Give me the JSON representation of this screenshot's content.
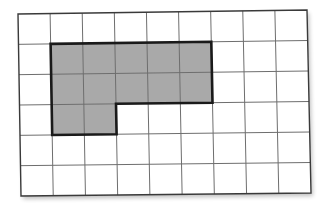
{
  "figure": {
    "type": "grid-area-diagram",
    "grid": {
      "columns": 9,
      "rows": 6
    },
    "shaded_shape": {
      "description": "L-shaped polygon",
      "cells": [
        [
          1,
          1
        ],
        [
          2,
          1
        ],
        [
          3,
          1
        ],
        [
          4,
          1
        ],
        [
          5,
          1
        ],
        [
          1,
          2
        ],
        [
          2,
          2
        ],
        [
          3,
          2
        ],
        [
          4,
          2
        ],
        [
          5,
          2
        ],
        [
          1,
          3
        ],
        [
          2,
          3
        ]
      ],
      "area_units": 12,
      "fill_color": "#a9a9a9",
      "outline_color": "#1a1a1a"
    },
    "colors": {
      "grid_line": "#6e6e6e",
      "background": "#ffffff",
      "border": "#3a3a3a"
    }
  }
}
